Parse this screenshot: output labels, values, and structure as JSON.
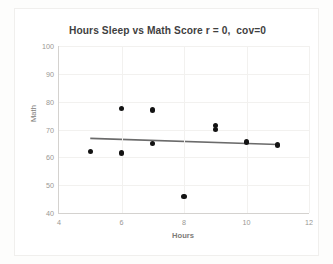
{
  "chart_data": {
    "type": "scatter",
    "title": "Hours Sleep vs Math Score r = 0,  cov=0",
    "xlabel": "Hours",
    "ylabel": "Math",
    "xlim": [
      4,
      12
    ],
    "ylim": [
      40,
      100
    ],
    "xticks": [
      4,
      6,
      8,
      10,
      12
    ],
    "yticks": [
      40,
      50,
      60,
      70,
      80,
      90,
      100
    ],
    "grid": true,
    "legend": "none",
    "series": [
      {
        "name": "Math score",
        "marker": "filled-circle",
        "color": "#131313",
        "points": [
          {
            "x": 5,
            "y": 62
          },
          {
            "x": 6,
            "y": 77.5
          },
          {
            "x": 6,
            "y": 61.5
          },
          {
            "x": 7,
            "y": 77
          },
          {
            "x": 7,
            "y": 65
          },
          {
            "x": 8,
            "y": 46
          },
          {
            "x": 9,
            "y": 71.5
          },
          {
            "x": 9,
            "y": 70
          },
          {
            "x": 10,
            "y": 65.5
          },
          {
            "x": 11,
            "y": 64.5
          }
        ]
      }
    ],
    "trendline": {
      "name": "linear-fit",
      "color": "#6b6b6b",
      "x_start": 5,
      "y_start": 66.8,
      "x_end": 11,
      "y_end": 64.6
    },
    "ytick_labels": [
      "100",
      "90",
      "80",
      "70",
      "60",
      "50",
      "40"
    ],
    "xtick_labels": [
      "4",
      "6",
      "8",
      "10",
      "12"
    ]
  }
}
